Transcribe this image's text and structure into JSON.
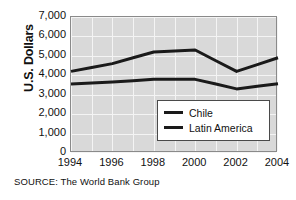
{
  "chart_data": {
    "type": "line",
    "title": "",
    "xlabel": "",
    "ylabel": "U.S. Dollars",
    "ylim": [
      0,
      7000
    ],
    "ytick_step": 1000,
    "yticks": [
      "0",
      "1,000",
      "2,000",
      "3,000",
      "4,000",
      "5,000",
      "6,000",
      "7,000"
    ],
    "ytick_values": [
      0,
      1000,
      2000,
      3000,
      4000,
      5000,
      6000,
      7000
    ],
    "xlim": [
      1994,
      2004
    ],
    "xticks": [
      "1994",
      "1996",
      "1998",
      "2000",
      "2002",
      "2004"
    ],
    "xtick_values": [
      1994,
      1996,
      1998,
      2000,
      2002,
      2004
    ],
    "x": [
      1994,
      1995,
      1996,
      1997,
      1998,
      1999,
      2000,
      2001,
      2002,
      2003,
      2004
    ],
    "grid": true,
    "legend_position": "bottom-right",
    "series": [
      {
        "name": "Chile",
        "color": "#1a1a1a",
        "values": [
          4200,
          4400,
          4600,
          4900,
          5200,
          5250,
          5300,
          4750,
          4200,
          4550,
          4900
        ]
      },
      {
        "name": "Latin America",
        "color": "#1a1a1a",
        "values": [
          3550,
          3600,
          3650,
          3720,
          3800,
          3800,
          3790,
          3550,
          3300,
          3430,
          3560
        ]
      }
    ],
    "source_note": "SOURCE: The World Bank Group"
  },
  "legend": {
    "items": [
      {
        "label": "Chile"
      },
      {
        "label": "Latin America"
      }
    ]
  },
  "colors": {
    "plot_background": "#d9d9d9",
    "gridline": "#f4f4f4",
    "plot_border": "#8a8a8a",
    "line": "#1a1a1a",
    "legend_background": "#ffffff",
    "legend_border": "#4a4a4a",
    "text": "#111111"
  }
}
